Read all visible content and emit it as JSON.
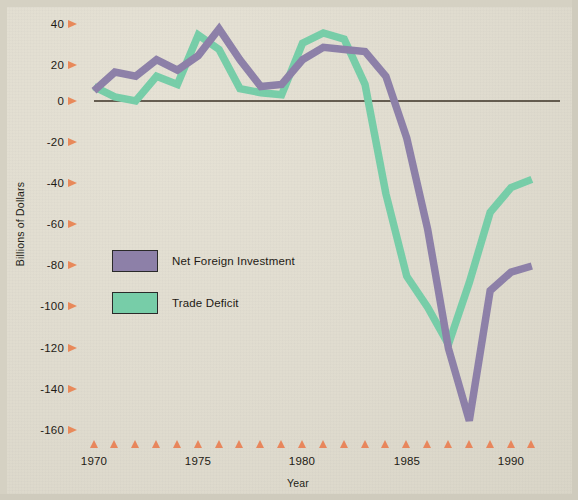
{
  "axes": {
    "ylabel": "Billions of Dollars",
    "xlabel": "Year",
    "yticks": [
      "40",
      "20",
      "0",
      "-20",
      "-40",
      "-60",
      "-80",
      "-100",
      "-120",
      "-140",
      "-160"
    ],
    "xticks": [
      "1970",
      "1975",
      "1980",
      "1985",
      "1990"
    ]
  },
  "legend": {
    "items": [
      {
        "label": "Net Foreign Investment",
        "color": "#8d80a8"
      },
      {
        "label": "Trade Deficit",
        "color": "#77cda8"
      }
    ]
  },
  "colors": {
    "background": "#e2ded1",
    "tick_arrow": "#e8895a",
    "axis_line": "#3b3226",
    "net_foreign_investment": "#8d80a8",
    "trade_deficit": "#77cda8",
    "text": "#1e1a14"
  },
  "chart_data": {
    "type": "line",
    "title": "",
    "xlabel": "Year",
    "ylabel": "Billions of Dollars",
    "xlim": [
      1969.3,
      1991.6
    ],
    "ylim": [
      -167,
      48
    ],
    "grid": false,
    "legend_position": "inside-left",
    "x": [
      1970,
      1971,
      1972,
      1973,
      1974,
      1975,
      1976,
      1977,
      1978,
      1979,
      1980,
      1981,
      1982,
      1983,
      1984,
      1985,
      1986,
      1987,
      1988,
      1989,
      1990,
      1991
    ],
    "series": [
      {
        "name": "Net Foreign Investment",
        "color": "#8d80a8",
        "values": [
          5,
          14,
          12,
          20,
          15,
          22,
          35,
          20,
          7,
          8,
          20,
          26,
          25,
          24,
          12,
          -18,
          -62,
          -120,
          -155,
          -92,
          -83,
          -80
        ]
      },
      {
        "name": "Trade Deficit",
        "color": "#77cda8",
        "values": [
          7,
          2,
          0,
          12,
          8,
          32,
          25,
          6,
          4,
          3,
          28,
          33,
          30,
          8,
          -45,
          -85,
          -100,
          -118,
          -88,
          -54,
          -42,
          -38
        ]
      }
    ],
    "yticks": [
      40,
      20,
      0,
      -20,
      -40,
      -60,
      -80,
      -100,
      -120,
      -140,
      -160
    ],
    "xticks_labeled": [
      1970,
      1975,
      1980,
      1985,
      1990
    ],
    "xtick_every": 1
  }
}
